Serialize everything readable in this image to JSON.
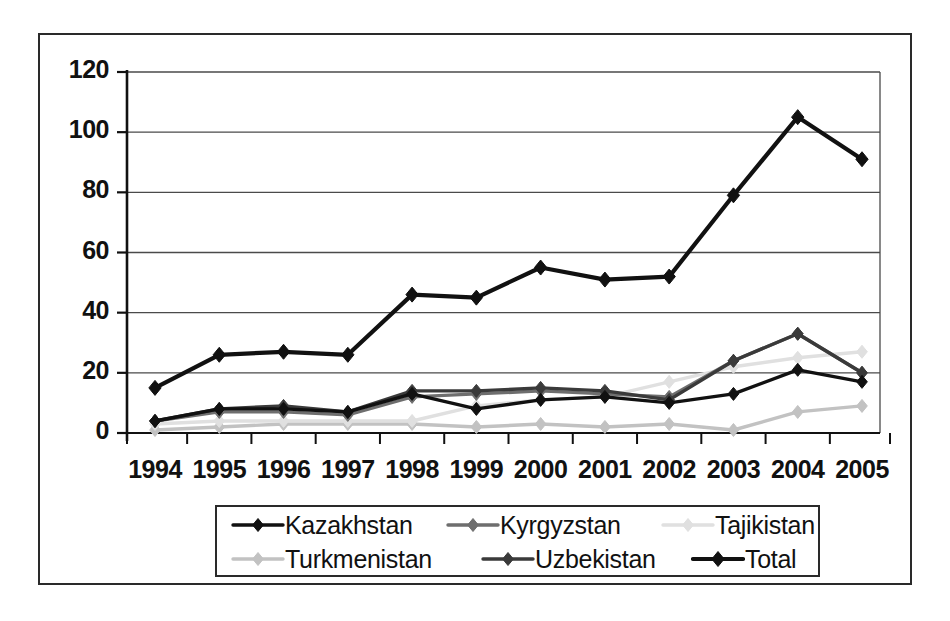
{
  "chart_data": {
    "type": "line",
    "title": "",
    "subtitle": "",
    "xlabel": "",
    "ylabel": "",
    "grid": true,
    "legend_position": "bottom",
    "xlim_categories": true,
    "ylim": [
      0,
      120
    ],
    "ytick_labels": [
      "0",
      "20",
      "40",
      "60",
      "80",
      "100",
      "120"
    ],
    "ytick_values": [
      0,
      20,
      40,
      60,
      80,
      100,
      120
    ],
    "categories": [
      "1994",
      "1995",
      "1996",
      "1997",
      "1998",
      "1999",
      "2000",
      "2001",
      "2002",
      "2003",
      "2004",
      "2005"
    ],
    "series": [
      {
        "name": "Kazakhstan",
        "color": "#111111",
        "values": [
          4,
          8,
          8,
          7,
          13,
          8,
          11,
          12,
          10,
          13,
          21,
          17
        ]
      },
      {
        "name": "Kyrgyzstan",
        "color": "#6e6e6e",
        "values": [
          4,
          7,
          7,
          6,
          12,
          13,
          14,
          13,
          12,
          24,
          33,
          20
        ]
      },
      {
        "name": "Tajikistan",
        "color": "#e0e0e0",
        "values": [
          3,
          4,
          4,
          4,
          4,
          9,
          11,
          12,
          17,
          22,
          25,
          27
        ]
      },
      {
        "name": "Turkmenistan",
        "color": "#c2c2c2",
        "values": [
          1,
          2,
          3,
          3,
          3,
          2,
          3,
          2,
          3,
          1,
          7,
          9
        ]
      },
      {
        "name": "Uzbekistan",
        "color": "#3a3a3a",
        "values": [
          4,
          8,
          9,
          7,
          14,
          14,
          15,
          14,
          11,
          24,
          33,
          20
        ]
      },
      {
        "name": "Total",
        "color": "#111111",
        "values": [
          15,
          26,
          27,
          26,
          46,
          45,
          55,
          51,
          52,
          79,
          105,
          91
        ]
      }
    ]
  },
  "legend": {
    "items": [
      {
        "label": "Kazakhstan",
        "color": "#111111"
      },
      {
        "label": "Kyrgyzstan",
        "color": "#6e6e6e"
      },
      {
        "label": "Tajikistan",
        "color": "#e0e0e0"
      },
      {
        "label": "Turkmenistan",
        "color": "#c2c2c2"
      },
      {
        "label": "Uzbekistan",
        "color": "#3a3a3a"
      },
      {
        "label": "Total",
        "color": "#111111"
      }
    ]
  }
}
